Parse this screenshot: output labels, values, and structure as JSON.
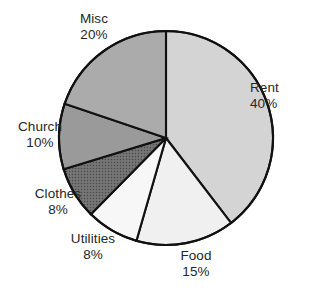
{
  "chart_data": {
    "type": "pie",
    "title": "",
    "subtitle": "",
    "xlabel": "",
    "ylabel": "",
    "legend_position": "none",
    "grid": false,
    "labels_outside": true,
    "start_angle_deg": 0,
    "direction": "clockwise",
    "categories": [
      "Rent",
      "Food",
      "Utilities",
      "Clothes",
      "Church",
      "Misc"
    ],
    "values": [
      40,
      15,
      8,
      8,
      10,
      20
    ],
    "value_unit": "%",
    "slices": [
      {
        "name": "Rent",
        "value": 40,
        "percent_label": "40%",
        "angle_deg": 144,
        "start_deg": 0,
        "end_deg": 144,
        "fill": "#d4d4d4",
        "texture": "none",
        "label_side": "right"
      },
      {
        "name": "Food",
        "value": 15,
        "percent_label": "15%",
        "angle_deg": 54,
        "start_deg": 144,
        "end_deg": 198,
        "fill": "#f0f0f0",
        "texture": "none",
        "label_side": "bottom"
      },
      {
        "name": "Utilities",
        "value": 8,
        "percent_label": "8%",
        "angle_deg": 28.8,
        "start_deg": 198,
        "end_deg": 226.8,
        "fill": "#f7f7f7",
        "texture": "none",
        "label_side": "bottom-left"
      },
      {
        "name": "Clothes",
        "value": 8,
        "percent_label": "8%",
        "angle_deg": 28.8,
        "start_deg": 226.8,
        "end_deg": 255.6,
        "fill": "#6e6e6e",
        "texture": "stipple",
        "label_side": "left"
      },
      {
        "name": "Church",
        "value": 10,
        "percent_label": "10%",
        "angle_deg": 36,
        "start_deg": 255.6,
        "end_deg": 291.6,
        "fill": "#9a9a9a",
        "texture": "none",
        "label_side": "left"
      },
      {
        "name": "Misc",
        "value": 20,
        "percent_label": "20%",
        "angle_deg": 72,
        "start_deg": 291.6,
        "end_deg": 363.6,
        "fill": "#ababab",
        "texture": "none",
        "label_side": "top-left"
      }
    ],
    "style": {
      "outline_color": "#111111",
      "outline_width_px": 2.1,
      "background": "#ffffff",
      "label_color": "#262626",
      "center_x": 166,
      "center_y": 138,
      "radius": 107
    }
  },
  "labels": {
    "rent": {
      "name": "Rent",
      "percent": "40%"
    },
    "food": {
      "name": "Food",
      "percent": "15%"
    },
    "utilities": {
      "name": "Utilities",
      "percent": "8%"
    },
    "clothes": {
      "name": "Clothes",
      "percent": "8%"
    },
    "church": {
      "name": "Church",
      "percent": "10%"
    },
    "misc": {
      "name": "Misc",
      "percent": "20%"
    }
  }
}
